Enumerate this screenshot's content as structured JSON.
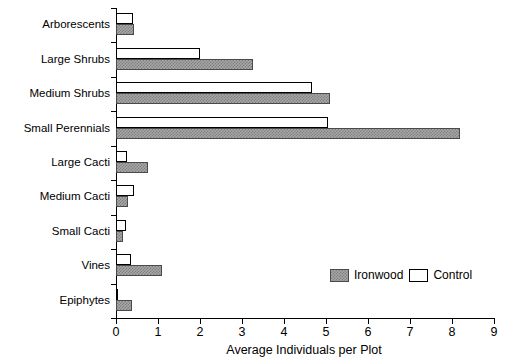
{
  "chart_data": {
    "type": "bar",
    "orientation": "horizontal",
    "title": "",
    "xlabel": "Average Individuals per Plot",
    "ylabel": "",
    "xlim": [
      0,
      9
    ],
    "ylim": null,
    "grid": false,
    "legend_position": "bottom-right",
    "xticks": [
      "0",
      "1",
      "2",
      "3",
      "4",
      "5",
      "6",
      "7",
      "8",
      "9"
    ],
    "categories": [
      "Arborescents",
      "Large Shrubs",
      "Medium Shrubs",
      "Small Perennials",
      "Large Cacti",
      "Medium Cacti",
      "Small Cacti",
      "Vines",
      "Epiphytes"
    ],
    "series": [
      {
        "name": "Control",
        "color": "#ffffff",
        "values": [
          0.4,
          2.0,
          4.67,
          5.05,
          0.26,
          0.43,
          0.24,
          0.35,
          0.03
        ]
      },
      {
        "name": "Ironwood",
        "color": "#a8a8a8",
        "values": [
          0.42,
          3.26,
          5.1,
          8.2,
          0.76,
          0.28,
          0.17,
          1.1,
          0.38
        ]
      }
    ]
  },
  "legend": {
    "items": [
      {
        "label": "Ironwood",
        "swatch": "ironwood"
      },
      {
        "label": "Control",
        "swatch": "control"
      }
    ]
  },
  "axis": {
    "x_title": "Average Individuals per Plot"
  }
}
